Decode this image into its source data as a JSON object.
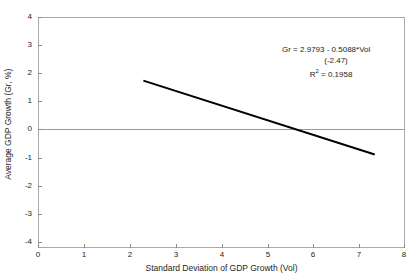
{
  "chart_data": {
    "type": "line",
    "title": "",
    "xlabel": "Standard Deviation of GDP Growth (Vol)",
    "ylabel": "Average GDP Growth (Gr, %)",
    "xlim": [
      0,
      8
    ],
    "ylim": [
      -4,
      4
    ],
    "xticks": [
      "0",
      "1",
      "2",
      "3",
      "4",
      "5",
      "6",
      "7",
      "8"
    ],
    "xtick_values": [
      0,
      1,
      2,
      3,
      4,
      5,
      6,
      7,
      8
    ],
    "yticks": [
      "4",
      "3",
      "2",
      "1",
      "0",
      "-1",
      "-2",
      "-3",
      "-4"
    ],
    "ytick_values": [
      4,
      3,
      2,
      1,
      0,
      -1,
      -2,
      -3,
      -4
    ],
    "grid": false,
    "legend": null,
    "zero_reference_line": 0,
    "series": [
      {
        "name": "Fitted regression line",
        "type": "line",
        "color": "#000000",
        "x": [
          2.3,
          7.35
        ],
        "y": [
          1.8,
          -0.75
        ]
      }
    ],
    "regression": {
      "intercept": 2.9793,
      "slope": -0.5088,
      "t_statistic": -2.47,
      "r_squared": 0.1958
    },
    "annotations": {
      "equation": "Gr = 2.9793 - 0.5088*Vol",
      "t_stat": "(-2.47)",
      "r2_prefix": "R",
      "r2_exponent": "2",
      "r2_value": " = 0.1958"
    },
    "colors": {
      "line": "#000000",
      "axis": "#a9a9a9",
      "zero_line": "#9a9a9a",
      "text": "#1d1d1d",
      "background": "#ffffff"
    }
  }
}
